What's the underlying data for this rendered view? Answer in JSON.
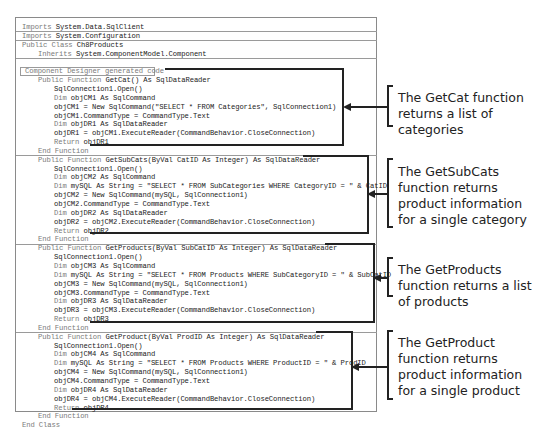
{
  "code": {
    "lines": [
      {
        "indent": 0,
        "kw": "Imports",
        "rest": " System.Data.SqlClient"
      },
      {
        "indent": 0,
        "kw": "Imports",
        "rest": " System.Configuration"
      },
      {
        "indent": 0,
        "kw": "Public Class",
        "rest": " Ch8Products"
      },
      {
        "indent": 1,
        "kw": "Inherits",
        "rest": " System.ComponentModel.Component"
      },
      {
        "indent": 0,
        "kw": "",
        "rest": ""
      },
      {
        "indent": 0,
        "kw": "Component Designer generated code",
        "rest": "",
        "region": true
      },
      {
        "indent": 1,
        "kw": "Public Function",
        "rest": " GetCat() As SqlDataReader"
      },
      {
        "indent": 2,
        "kw": "",
        "rest": "SqlConnection1.Open()"
      },
      {
        "indent": 2,
        "kw": "Dim",
        "rest": " objCM1 As SqlCommand"
      },
      {
        "indent": 2,
        "kw": "",
        "rest": "objCM1 = New SqlCommand(\"SELECT * FROM Categories\", SqlConnection1)"
      },
      {
        "indent": 2,
        "kw": "",
        "rest": "objCM1.CommandType = CommandType.Text"
      },
      {
        "indent": 2,
        "kw": "Dim",
        "rest": " objDR1 As SqlDataReader"
      },
      {
        "indent": 2,
        "kw": "",
        "rest": "objDR1 = objCM1.ExecuteReader(CommandBehavior.CloseConnection)"
      },
      {
        "indent": 2,
        "kw": "Return",
        "rest": " objDR1"
      },
      {
        "indent": 1,
        "kw": "End Function",
        "rest": ""
      },
      {
        "indent": 1,
        "kw": "Public Function",
        "rest": " GetSubCats(ByVal CatID As Integer) As SqlDataReader"
      },
      {
        "indent": 2,
        "kw": "",
        "rest": "SqlConnection1.Open()"
      },
      {
        "indent": 2,
        "kw": "Dim",
        "rest": " objCM2 As SqlCommand"
      },
      {
        "indent": 2,
        "kw": "Dim",
        "rest": " mySQL As String = \"SELECT * FROM SubCategories WHERE CategoryID = \" & CatID"
      },
      {
        "indent": 2,
        "kw": "",
        "rest": "objCM2 = New SqlCommand(mySQL, SqlConnection1)"
      },
      {
        "indent": 2,
        "kw": "",
        "rest": "objCM2.CommandType = CommandType.Text"
      },
      {
        "indent": 2,
        "kw": "Dim",
        "rest": " objDR2 As SqlDataReader"
      },
      {
        "indent": 2,
        "kw": "",
        "rest": "objDR2 = objCM2.ExecuteReader(CommandBehavior.CloseConnection)"
      },
      {
        "indent": 2,
        "kw": "Return",
        "rest": " objDR2"
      },
      {
        "indent": 1,
        "kw": "End Function",
        "rest": ""
      },
      {
        "indent": 1,
        "kw": "Public Function",
        "rest": " GetProducts(ByVal SubCatID As Integer) As SqlDataReader"
      },
      {
        "indent": 2,
        "kw": "",
        "rest": "SqlConnection1.Open()"
      },
      {
        "indent": 2,
        "kw": "Dim",
        "rest": " objCM3 As SqlCommand"
      },
      {
        "indent": 2,
        "kw": "Dim",
        "rest": " mySQL As String = \"SELECT * FROM Products WHERE SubCategoryID = \" & SubCatID"
      },
      {
        "indent": 2,
        "kw": "",
        "rest": "objCM3 = New SqlCommand(mySQL, SqlConnection1)"
      },
      {
        "indent": 2,
        "kw": "",
        "rest": "objCM3.CommandType = CommandType.Text"
      },
      {
        "indent": 2,
        "kw": "Dim",
        "rest": " objDR3 As SqlDataReader"
      },
      {
        "indent": 2,
        "kw": "",
        "rest": "objDR3 = objCM3.ExecuteReader(CommandBehavior.CloseConnection)"
      },
      {
        "indent": 2,
        "kw": "Return",
        "rest": " objDR3"
      },
      {
        "indent": 1,
        "kw": "End Function",
        "rest": ""
      },
      {
        "indent": 1,
        "kw": "Public Function",
        "rest": " GetProduct(ByVal ProdID As Integer) As SqlDataReader"
      },
      {
        "indent": 2,
        "kw": "",
        "rest": "SqlConnection1.Open()"
      },
      {
        "indent": 2,
        "kw": "Dim",
        "rest": " objCM4 As SqlCommand"
      },
      {
        "indent": 2,
        "kw": "Dim",
        "rest": " mySQL As String = \"SELECT * FROM Products WHERE ProductID = \" & ProdID"
      },
      {
        "indent": 2,
        "kw": "",
        "rest": "objCM4 = New SqlCommand(mySQL, SqlConnection1)"
      },
      {
        "indent": 2,
        "kw": "",
        "rest": "objCM4.CommandType = CommandType.Text"
      },
      {
        "indent": 2,
        "kw": "Dim",
        "rest": " objDR4 As SqlDataReader"
      },
      {
        "indent": 2,
        "kw": "",
        "rest": "objDR4 = objCM4.ExecuteReader(CommandBehavior.CloseConnection)"
      },
      {
        "indent": 2,
        "kw": "Return",
        "rest": " objDR4"
      },
      {
        "indent": 1,
        "kw": "End Function",
        "rest": ""
      },
      {
        "indent": 0,
        "kw": "End Class",
        "rest": ""
      }
    ]
  },
  "annotations": [
    {
      "name": "getcat",
      "text": "The GetCat function returns a list of categories"
    },
    {
      "name": "getsubcats",
      "text": "The GetSubCats function returns product information for a single category"
    },
    {
      "name": "getproducts",
      "text": "The GetProducts function returns a list of products"
    },
    {
      "name": "getproduct",
      "text": "The GetProduct function returns product information for a single product"
    }
  ]
}
